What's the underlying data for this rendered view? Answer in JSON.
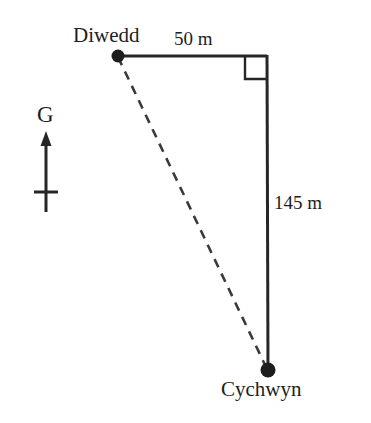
{
  "diagram": {
    "type": "geometry-diagram",
    "background_color": "#ffffff",
    "stroke_color": "#262626",
    "text_color": "#1d1d1d",
    "canvas": {
      "width": 371,
      "height": 423
    },
    "vertices": [
      {
        "id": "diwedd",
        "label": "Diwedd",
        "x": 118,
        "y": 56,
        "marker": "filled-dot",
        "marker_radius": 6,
        "label_position": "above-left"
      },
      {
        "id": "corner",
        "label": "",
        "x": 267,
        "y": 56,
        "marker": "none",
        "right_angle": true
      },
      {
        "id": "cychwyn",
        "label": "Cychwyn",
        "x": 268,
        "y": 370,
        "marker": "filled-dot",
        "marker_radius": 7,
        "label_position": "below"
      }
    ],
    "edges": [
      {
        "id": "top-leg",
        "from": "diwedd",
        "to": "corner",
        "style": "solid",
        "length_label": "50 m"
      },
      {
        "id": "right-leg",
        "from": "corner",
        "to": "cychwyn",
        "style": "solid",
        "length_label": "145 m"
      },
      {
        "id": "hypotenuse",
        "from": "diwedd",
        "to": "cychwyn",
        "style": "dashed",
        "length_label": ""
      }
    ],
    "right_angle_marker": {
      "at_vertex": "corner",
      "size": 22,
      "name": "right-angle-square"
    },
    "compass": {
      "label": "G",
      "meaning": "north-indicator",
      "arrow_tip": {
        "x": 46,
        "y": 133
      },
      "arrow_tail": {
        "x": 46,
        "y": 212
      },
      "crossbar_y": 192,
      "crossbar_half_width": 12
    }
  }
}
